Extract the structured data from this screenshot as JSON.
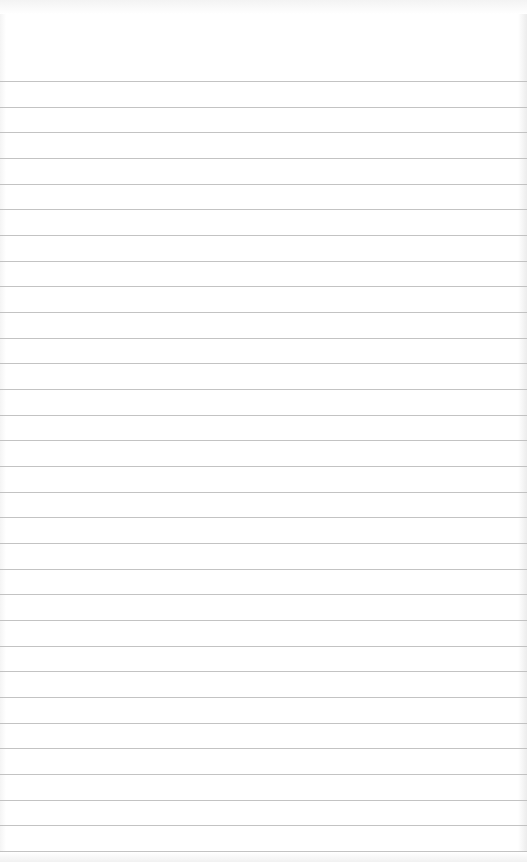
{
  "paper": {
    "type": "lined-notebook-paper",
    "background_color": "#ffffff",
    "rule_color": "#b9b9b9",
    "first_rule_y": 81,
    "rule_spacing": 25.67,
    "rule_count": 31
  }
}
